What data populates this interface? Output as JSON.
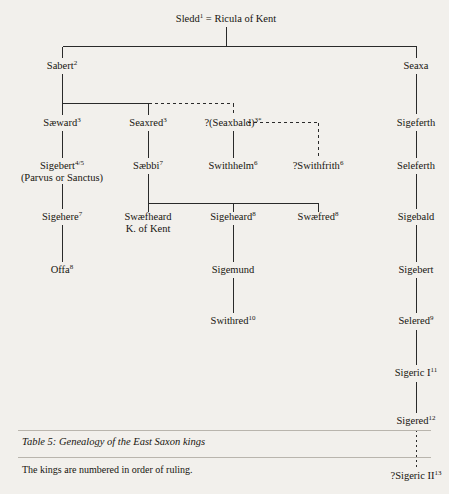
{
  "diagram": {
    "title": "Genealogy of the East Saxon kings",
    "caption": "Table 5:  Genealogy of the East Saxon kings",
    "note": "The kings are numbered in order of ruling.",
    "nodes": {
      "sledd": "Sledd",
      "sledd_sup": "1",
      "marriage": "=",
      "ricula": "Ricula of Kent",
      "sabert": "Sabert",
      "sabert_sup": "2",
      "seaxa": "Seaxa",
      "saeward": "Sæward",
      "saeward_sup": "3",
      "seaxred": "Seaxred",
      "seaxred_sup": "3",
      "seaxbald": "?(Seaxbald)",
      "seaxbald_sup": "3*",
      "sigeferth": "Sigeferth",
      "sigebert45": "Sigebert",
      "sigebert45_sup": "4/5",
      "sigebert45_alt": "(Parvus or Sanctus)",
      "saebbi": "Sæbbi",
      "saebbi_sup": "7",
      "swithhelm": "Swithhelm",
      "swithhelm_sup": "6",
      "swithfrith": "?Swithfrith",
      "swithfrith_sup": "6",
      "seleferth": "Seleferth",
      "sigehere": "Sigehere",
      "sigehere_sup": "7",
      "swaefheard": "Swæfheard",
      "swaefheard_title": "K. of Kent",
      "sigeheard": "Sigeheard",
      "sigeheard_sup": "8",
      "swaefred": "Swæfred",
      "swaefred_sup": "8",
      "sigebald": "Sigebald",
      "offa": "Offa",
      "offa_sup": "8",
      "sigemund": "Sigemund",
      "sigebert_r": "Sigebert",
      "swithred": "Swithred",
      "swithred_sup": "10",
      "selered": "Selered",
      "selered_sup": "9",
      "sigeric1": "Sigeric I",
      "sigeric1_sup": "11",
      "sigered": "Sigered",
      "sigered_sup": "12",
      "sigeric2": "?Sigeric II",
      "sigeric2_sup": "13"
    },
    "colors": {
      "page_background": "#f2f0ec",
      "ink": "#17150f",
      "line": "#2a2a2a",
      "rule": "#b9b5ad"
    }
  }
}
